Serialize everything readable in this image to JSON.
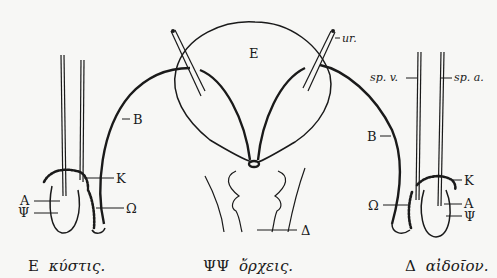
{
  "figure": {
    "center": {
      "labels": {
        "bladder": "E",
        "ureter": "ur.",
        "penis": "Δ"
      },
      "caption": {
        "symbol": "ΨΨ",
        "word": "ὄρχεις."
      }
    },
    "left": {
      "labels": {
        "duct": "B",
        "epididymis_top": "K",
        "epididymis": "Ω",
        "vessel": "A",
        "testis": "Ψ"
      },
      "caption": {
        "symbol": "E",
        "word": "κύστις."
      }
    },
    "right": {
      "labels": {
        "vein": "sp. v.",
        "artery": "sp. a.",
        "duct": "B",
        "epididymis_top": "K",
        "epididymis": "Ω",
        "vessel": "A",
        "testis": "Ψ"
      },
      "caption": {
        "symbol": "Δ",
        "word": "αἰδοῖον."
      }
    }
  }
}
